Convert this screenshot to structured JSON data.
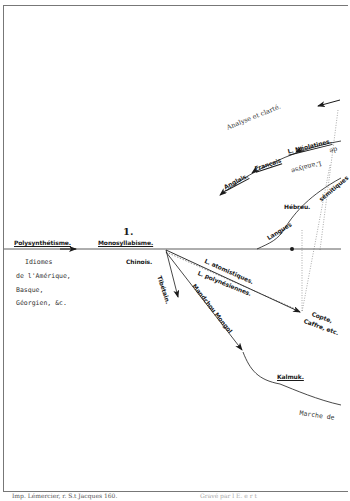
{
  "diagram": {
    "stage_number": "1.",
    "axis_labels": {
      "left": "Polysynthétisme.",
      "center": "Monosyllabisme."
    },
    "left_notes": [
      "Idiomes",
      "de l'Amérique,",
      "Basque,",
      "Géorgien, &c."
    ],
    "nodes": {
      "chinois": "Chinois.",
      "tibetain": "Tibétain.",
      "hebreu": "Hébreu.",
      "langues": "Langues",
      "semitiques": "sémitiques",
      "copte": "Copte,",
      "caffre": "Caffre, etc.",
      "kalmuk": "Kalmuk."
    },
    "branches": {
      "atomistiques": "L. atomistiques.",
      "polynesiennes": "L. polynésiennes.",
      "mandchou": "Mandchou Mongol",
      "neolatines": "L. Néolatines.",
      "francais": "Français",
      "anglais": "Anglais."
    },
    "annotations": {
      "analyse": "Analyse et clarté.",
      "inverted": "L'analyse",
      "inverted_suffix": "de",
      "marche": "Marche de"
    },
    "footer": {
      "imprint": "Imp. Lémercier, r. S.t Jacques 160.",
      "right": "Gravé   par   l   E.   e   r   t"
    },
    "colors": {
      "ink": "#1a1a1a",
      "faint": "#777777",
      "paper": "#ffffff"
    }
  }
}
